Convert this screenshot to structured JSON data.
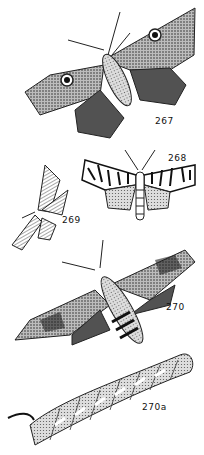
{
  "plate": {
    "figures": [
      {
        "label": "267",
        "subject": "moth-with-eyespots"
      },
      {
        "label": "268",
        "subject": "tiger-moth"
      },
      {
        "label": "269",
        "subject": "striped-wing-moth"
      },
      {
        "label": "270",
        "subject": "hawk-moth"
      },
      {
        "label": "270a",
        "subject": "hawk-moth-caterpillar"
      }
    ]
  }
}
